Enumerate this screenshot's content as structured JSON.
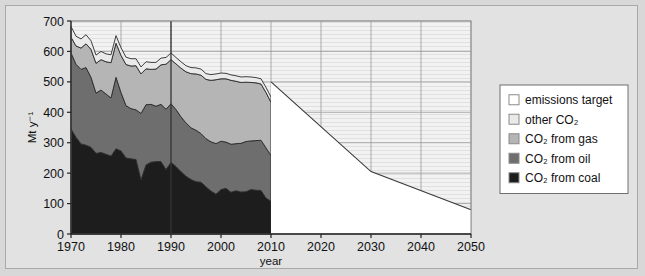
{
  "figure": {
    "background": "#e2e2e2",
    "border_color": "#a9a9a9"
  },
  "chart_data": {
    "type": "area",
    "title": "",
    "subtitle": "",
    "xlabel": "year",
    "ylabel": "Mt y⁻¹",
    "xlim": [
      1970,
      2050
    ],
    "ylim": [
      0,
      700
    ],
    "xticks": [
      1970,
      1980,
      1990,
      2000,
      2010,
      2020,
      2030,
      2040,
      2050
    ],
    "yticks": [
      0,
      100,
      200,
      300,
      400,
      500,
      600,
      700
    ],
    "grid": true,
    "legend_position": "right",
    "stacked": true,
    "marker_line_year": 1990,
    "history_end_year": 2010,
    "x": [
      1970,
      1971,
      1972,
      1973,
      1974,
      1975,
      1976,
      1977,
      1978,
      1979,
      1980,
      1981,
      1982,
      1983,
      1984,
      1985,
      1986,
      1987,
      1988,
      1989,
      1990,
      1991,
      1992,
      1993,
      1994,
      1995,
      1996,
      1997,
      1998,
      1999,
      2000,
      2001,
      2002,
      2003,
      2004,
      2005,
      2006,
      2007,
      2008,
      2009,
      2010
    ],
    "series": [
      {
        "name": "CO₂ from coal",
        "color": "#1d1d1d",
        "values": [
          345,
          318,
          296,
          292,
          285,
          265,
          268,
          262,
          256,
          280,
          273,
          250,
          247,
          245,
          178,
          227,
          236,
          238,
          238,
          212,
          235,
          222,
          205,
          190,
          179,
          172,
          170,
          155,
          141,
          131,
          146,
          150,
          137,
          142,
          138,
          139,
          146,
          144,
          143,
          118,
          108
        ]
      },
      {
        "name": "CO₂ from oil",
        "color": "#6e6e6e",
        "values": [
          250,
          240,
          245,
          255,
          230,
          198,
          205,
          198,
          191,
          235,
          192,
          172,
          165,
          163,
          218,
          198,
          190,
          182,
          188,
          198,
          193,
          187,
          180,
          175,
          170,
          169,
          160,
          158,
          162,
          166,
          159,
          152,
          158,
          155,
          160,
          165,
          160,
          163,
          165,
          165,
          150
        ]
      },
      {
        "name": "CO₂ from gas",
        "color": "#b5b5b5",
        "values": [
          52,
          60,
          70,
          78,
          92,
          98,
          100,
          106,
          116,
          112,
          122,
          135,
          140,
          145,
          130,
          118,
          115,
          122,
          130,
          148,
          145,
          150,
          160,
          168,
          178,
          185,
          192,
          195,
          202,
          210,
          205,
          208,
          210,
          205,
          200,
          195,
          192,
          190,
          185,
          182,
          175
        ]
      },
      {
        "name": "other CO₂",
        "color": "#eaeaea",
        "values": [
          35,
          32,
          30,
          30,
          28,
          27,
          27,
          26,
          26,
          25,
          25,
          24,
          24,
          23,
          23,
          23,
          23,
          22,
          22,
          22,
          22,
          21,
          21,
          20,
          20,
          20,
          20,
          19,
          19,
          19,
          19,
          18,
          18,
          18,
          18,
          18,
          18,
          17,
          17,
          17,
          17
        ]
      }
    ],
    "target": {
      "name": "emissions target",
      "color": "#ffffff",
      "line_color": "#3a3a3a",
      "x": [
        2010,
        2030,
        2050
      ],
      "values": [
        500,
        205,
        80
      ]
    }
  },
  "legend": {
    "items": [
      {
        "label": "emissions target",
        "swatch": "#ffffff"
      },
      {
        "label": "other CO₂",
        "swatch": "#eaeaea"
      },
      {
        "label": "CO₂ from gas",
        "swatch": "#b5b5b5"
      },
      {
        "label": "CO₂ from oil",
        "swatch": "#6e6e6e"
      },
      {
        "label": "CO₂ from coal",
        "swatch": "#1d1d1d"
      }
    ]
  }
}
